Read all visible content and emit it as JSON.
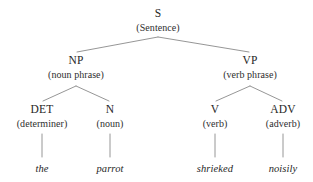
{
  "diagram": {
    "type": "syntax-parse-tree",
    "line_color": "#8a8a8a",
    "text_color": "#262626",
    "background": "#ffffff"
  },
  "nodes": {
    "s": {
      "label": "S",
      "gloss": "(Sentence)",
      "x": 158,
      "y": 8
    },
    "np": {
      "label": "NP",
      "gloss": "(noun phrase)",
      "x": 76,
      "y": 55
    },
    "vp": {
      "label": "VP",
      "gloss": "(verb phrase)",
      "x": 250,
      "y": 55
    },
    "det": {
      "label": "DET",
      "gloss": "(determiner)",
      "x": 42,
      "y": 104
    },
    "n": {
      "label": "N",
      "gloss": "(noun)",
      "x": 110,
      "y": 104
    },
    "v": {
      "label": "V",
      "gloss": "(verb)",
      "x": 215,
      "y": 104
    },
    "adv": {
      "label": "ADV",
      "gloss": "(adverb)",
      "x": 283,
      "y": 104
    }
  },
  "leaves": {
    "det_word": {
      "text": "the",
      "x": 42,
      "y": 163
    },
    "n_word": {
      "text": "parrot",
      "x": 110,
      "y": 163
    },
    "v_word": {
      "text": "shrieked",
      "x": 215,
      "y": 163
    },
    "adv_word": {
      "text": "noisily",
      "x": 283,
      "y": 163
    }
  },
  "sentence": "the parrot shrieked noisily"
}
